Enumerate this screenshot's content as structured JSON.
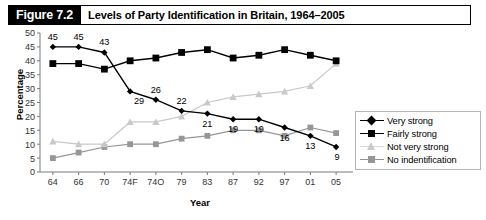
{
  "figure": {
    "badge": "Figure 7.2",
    "title": "Levels of Party Identification in Britain, 1964–2005"
  },
  "axes": {
    "ylabel": "Percentage",
    "xlabel": "Year",
    "yticks": [
      "0",
      "5",
      "10",
      "15",
      "20",
      "25",
      "30",
      "35",
      "40",
      "45",
      "50"
    ],
    "xticks": [
      "64",
      "66",
      "70",
      "74F",
      "74O",
      "79",
      "83",
      "87",
      "92",
      "97",
      "01",
      "05"
    ]
  },
  "legend": {
    "items": [
      {
        "label": "Very strong",
        "marker": "diamond",
        "color": "#000000"
      },
      {
        "label": "Fairly strong",
        "marker": "square",
        "color": "#000000"
      },
      {
        "label": "Not very strong",
        "marker": "triangle",
        "color": "#c9c9c9"
      },
      {
        "label": "No indentification",
        "marker": "square",
        "color": "#969696"
      }
    ]
  },
  "chart_data": {
    "type": "line",
    "title": "Levels of Party Identification in Britain, 1964–2005",
    "xlabel": "Year",
    "ylabel": "Percentage",
    "ylim": [
      0,
      50
    ],
    "ytick_step": 5,
    "grid": false,
    "legend_position": "right",
    "categories": [
      "64",
      "66",
      "70",
      "74F",
      "74O",
      "79",
      "83",
      "87",
      "92",
      "97",
      "01",
      "05"
    ],
    "series": [
      {
        "name": "Very strong",
        "marker": "diamond",
        "color": "#000000",
        "values": [
          45,
          45,
          43,
          29,
          26,
          22,
          21,
          19,
          19,
          16,
          13,
          9
        ],
        "data_labels": [
          "45",
          "45",
          "43",
          "29",
          "26",
          "22",
          "21",
          "19",
          "19",
          "16",
          "13",
          "9"
        ]
      },
      {
        "name": "Fairly strong",
        "marker": "square",
        "color": "#000000",
        "values": [
          39,
          39,
          37,
          40,
          41,
          43,
          44,
          41,
          42,
          44,
          42,
          40
        ]
      },
      {
        "name": "Not very strong",
        "marker": "triangle",
        "color": "#c9c9c9",
        "values": [
          11,
          10,
          10,
          18,
          18,
          20,
          25,
          27,
          28,
          29,
          31,
          39
        ]
      },
      {
        "name": "No indentification",
        "marker": "square",
        "color": "#969696",
        "values": [
          5,
          7,
          9,
          10,
          10,
          12,
          13,
          15,
          15,
          13,
          16,
          14
        ]
      }
    ]
  }
}
